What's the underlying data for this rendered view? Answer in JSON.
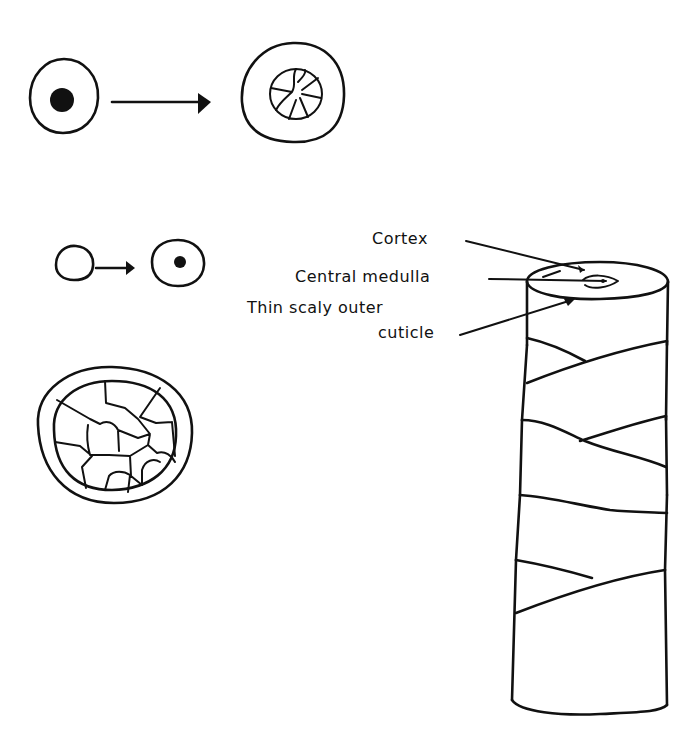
{
  "diagram": {
    "colors": {
      "ink": "#111111",
      "background": "#ffffff"
    },
    "labels": {
      "cortex": "Cortex",
      "medulla": "Central medulla",
      "cuticle_line1": "Thin scaly outer",
      "cuticle_line2": "cuticle"
    },
    "elements": [
      {
        "id": "cell-with-nucleus",
        "description": "round cell with solid black nucleus"
      },
      {
        "id": "arrow-1",
        "description": "arrow pointing right"
      },
      {
        "id": "cell-with-segmented-core",
        "description": "cell with radially segmented inner core"
      },
      {
        "id": "small-empty-cell",
        "description": "small empty cell"
      },
      {
        "id": "arrow-2",
        "description": "short arrow pointing right"
      },
      {
        "id": "small-nucleated-cell",
        "description": "small cell with nucleus"
      },
      {
        "id": "hair-cross-section",
        "description": "cross-section with double outer wall and polygonal inner cells"
      },
      {
        "id": "hair-shaft",
        "description": "cylindrical hair shaft with overlapping scales"
      }
    ]
  }
}
